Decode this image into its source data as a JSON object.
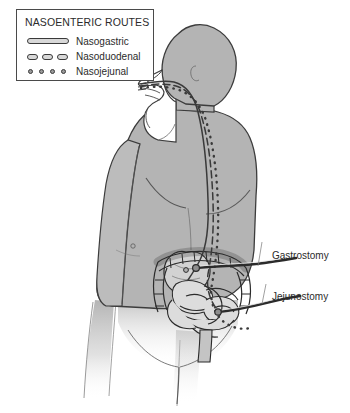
{
  "figure": {
    "width": 350,
    "height": 413,
    "background": "#ffffff"
  },
  "legend": {
    "title": "NASOENTERIC ROUTES",
    "items": [
      {
        "label": "Nasogastric",
        "style": "solid",
        "icon": "solid-tube-icon",
        "color": "#3a3a3a"
      },
      {
        "label": "Nasoduodenal",
        "style": "dashed",
        "icon": "dashed-tube-icon",
        "color": "#3a3a3a"
      },
      {
        "label": "Nasojejunal",
        "style": "dotted",
        "icon": "dotted-tube-icon",
        "color": "#3a3a3a"
      }
    ]
  },
  "callouts": [
    {
      "id": "gastrostomy",
      "label": "Gastrostomy",
      "x": 272,
      "y": 250
    },
    {
      "id": "jejunostomy",
      "label": "Jejunostomy",
      "x": 272,
      "y": 291
    }
  ],
  "colors": {
    "body_fill": "#b4b4b4",
    "body_fill_light": "#c6c6c6",
    "face_fill": "#ffffff",
    "organ_fill": "#d2d2d2",
    "organ_fill_light": "#e2e2e2",
    "outline": "#2b2b2b",
    "tube_stroke": "#3a3a3a",
    "text": "#2b2b2b",
    "legend_border": "#4a4a4a"
  },
  "anatomy": {
    "view": "posterior three-quarter torso of a standing human figure",
    "regions": [
      "head-profile",
      "neck",
      "shoulders",
      "arm",
      "torso",
      "abdomen",
      "pelvis",
      "legs"
    ],
    "organs": [
      "stomach",
      "duodenum",
      "jejunum",
      "small-intestine",
      "colon",
      "rectum"
    ],
    "tubes": [
      "nasogastric-tube",
      "nasoduodenal-tube",
      "nasojejunal-tube",
      "gastrostomy-tube",
      "jejunostomy-tube"
    ]
  }
}
